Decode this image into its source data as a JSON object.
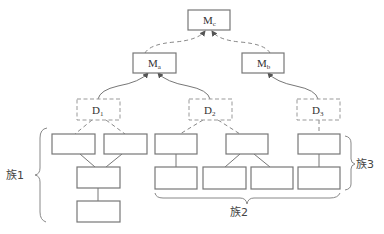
{
  "diagram": {
    "type": "hierarchy",
    "nodes": {
      "mc": {
        "base": "M",
        "sub": "c"
      },
      "ma": {
        "base": "M",
        "sub": "a"
      },
      "mb": {
        "base": "M",
        "sub": "b"
      },
      "d1": {
        "base": "D",
        "sub": "1"
      },
      "d2": {
        "base": "D",
        "sub": "2"
      },
      "d3": {
        "base": "D",
        "sub": "3"
      }
    },
    "families": [
      {
        "label": "族1"
      },
      {
        "label": "族2"
      },
      {
        "label": "族3"
      }
    ],
    "edges": [
      {
        "from": "ma",
        "to": "mc",
        "style": "dashed-arrow"
      },
      {
        "from": "mb",
        "to": "mc",
        "style": "dashed-arrow"
      },
      {
        "from": "d1",
        "to": "ma",
        "style": "solid-arrow"
      },
      {
        "from": "d2",
        "to": "ma",
        "style": "solid-arrow"
      },
      {
        "from": "d3",
        "to": "mb",
        "style": "solid-arrow"
      }
    ],
    "colors": {
      "stroke": "#777777",
      "dashed_stroke": "#999999",
      "text": "#333333"
    }
  }
}
